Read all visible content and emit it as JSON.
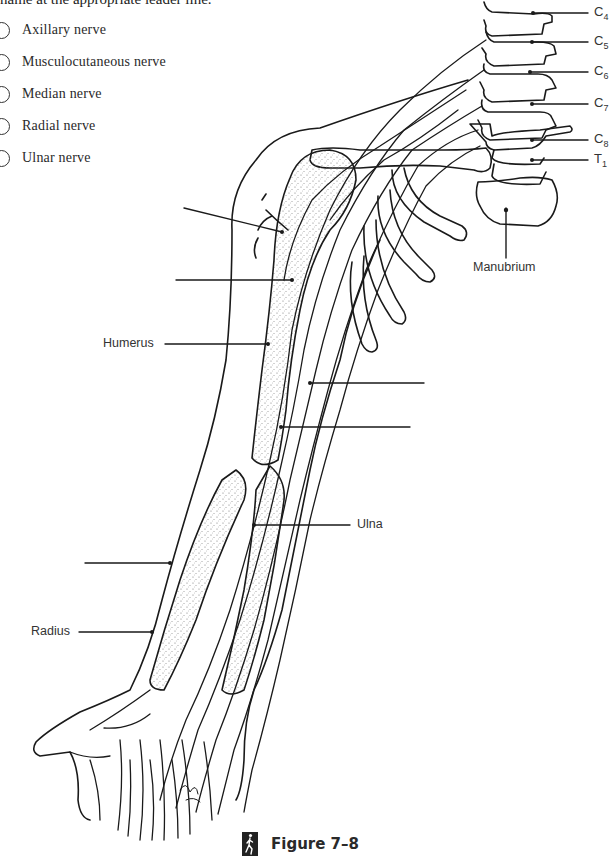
{
  "instruction": "name at the appropriate leader line.",
  "options": [
    {
      "label": "Axillary nerve"
    },
    {
      "label": "Musculocutaneous nerve"
    },
    {
      "label": "Median nerve"
    },
    {
      "label": "Radial nerve"
    },
    {
      "label": "Ulnar nerve"
    }
  ],
  "labels": {
    "humerus": "Humerus",
    "ulna": "Ulna",
    "radius": "Radius",
    "manubrium": "Manubrium"
  },
  "vertebrae": [
    {
      "letter": "C",
      "sub": "4"
    },
    {
      "letter": "C",
      "sub": "5"
    },
    {
      "letter": "C",
      "sub": "6"
    },
    {
      "letter": "C",
      "sub": "7"
    },
    {
      "letter": "C",
      "sub": "8"
    },
    {
      "letter": "T",
      "sub": "1"
    }
  ],
  "caption": {
    "icon": "walking-figure-icon",
    "text": "Figure 7–8"
  },
  "answer_blanks": 6
}
